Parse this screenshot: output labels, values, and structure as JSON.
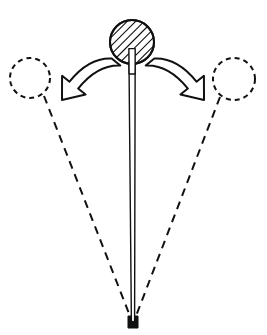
{
  "figure": {
    "title": "Pendulum rod pivoting about a fixed base",
    "canvas": {
      "width": 267,
      "height": 335
    },
    "background_color": "#ffffff",
    "ink_color": "#111111"
  },
  "bob": {
    "label": "hatched-bob",
    "center_x": 132,
    "center_y": 42,
    "radius": 22,
    "fill": "#ffffff",
    "stroke": "#111111",
    "stroke_width": 2,
    "hatch_angle_deg": 45,
    "hatch_spacing": 6,
    "hatch_count": 9
  },
  "rod": {
    "label": "pendulum-rod",
    "top_x": 132,
    "top_y": 42,
    "bottom_x": 133,
    "bottom_y": 322,
    "top_half_width": 3.2,
    "bottom_half_width": 1.6,
    "stroke": "#111111",
    "stroke_width": 1.4,
    "fill": "#ffffff"
  },
  "pivot": {
    "label": "pivot-base",
    "x": 128,
    "y": 316,
    "width": 10,
    "height": 12,
    "notch_width": 4,
    "fill": "#111111"
  },
  "ghost_positions": [
    {
      "name": "ghost-bob-left",
      "center_x": 30,
      "center_y": 78,
      "radius": 20,
      "dash": "5 4",
      "stroke_width": 2
    },
    {
      "name": "ghost-bob-right",
      "center_x": 234,
      "center_y": 79,
      "radius": 21,
      "dash": "5 4",
      "stroke_width": 2
    }
  ],
  "swing_paths": [
    {
      "name": "swing-path-left",
      "from_x": 44,
      "from_y": 96,
      "to_x": 130,
      "to_y": 316,
      "dash": "8 6",
      "stroke_width": 2
    },
    {
      "name": "swing-path-right",
      "from_x": 220,
      "from_y": 97,
      "to_x": 136,
      "to_y": 316,
      "dash": "8 6",
      "stroke_width": 2
    }
  ],
  "motion_arrows": [
    {
      "name": "motion-arrow-left",
      "direction": "counterclockwise-left",
      "tail_x": 116,
      "tail_y": 62,
      "tip_x": 62,
      "tip_y": 100,
      "fill": "#ffffff",
      "stroke": "#111111",
      "stroke_width": 2
    },
    {
      "name": "motion-arrow-right",
      "direction": "clockwise-right",
      "tail_x": 150,
      "tail_y": 62,
      "tip_x": 204,
      "tip_y": 100,
      "fill": "#ffffff",
      "stroke": "#111111",
      "stroke_width": 2
    }
  ],
  "accessibility": {
    "figure_description": "A vertical rod with a diagonally hatched circular bob at its top pivots about a small dark base at the bottom. Two dashed circles at the upper left and upper right show displaced bob positions, connected to the pivot by dashed swing lines. Two hollow curved arrows point outward and downward from the bob, indicating the directions of the swing."
  }
}
